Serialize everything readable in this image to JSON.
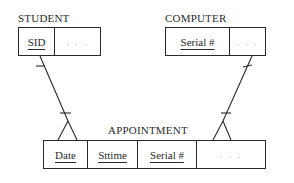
{
  "diagram": {
    "type": "entity-relationship",
    "entities": [
      {
        "id": "student",
        "title": "STUDENT",
        "attributes": [
          {
            "label": "SID",
            "key": true
          },
          {
            "label": ". . .",
            "key": false
          }
        ]
      },
      {
        "id": "computer",
        "title": "COMPUTER",
        "attributes": [
          {
            "label": "Serial #",
            "key": true
          },
          {
            "label": ". . .",
            "key": false
          }
        ]
      },
      {
        "id": "appointment",
        "title": "APPOINTMENT",
        "attributes": [
          {
            "label": "Date",
            "key": true
          },
          {
            "label": "Sttime",
            "key": true
          },
          {
            "label": "Serial #",
            "key": true
          },
          {
            "label": ". . .",
            "key": false
          }
        ]
      }
    ],
    "relationships": [
      {
        "from": "student",
        "to": "appointment",
        "from_cardinality": "one",
        "to_cardinality": "many"
      },
      {
        "from": "computer",
        "to": "appointment",
        "from_cardinality": "one",
        "to_cardinality": "many"
      }
    ],
    "colors": {
      "line": "#2a2a2a",
      "ellipsis": "#b5b5b5",
      "background": "#ffffff"
    }
  }
}
